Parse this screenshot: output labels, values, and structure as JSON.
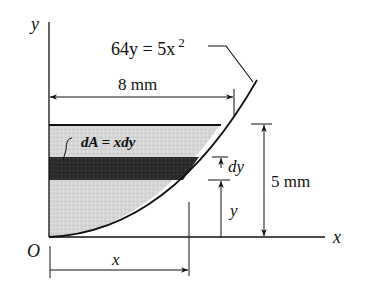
{
  "diagram": {
    "type": "area-element-diagram",
    "axes": {
      "y_label": "y",
      "x_label": "x",
      "origin_label": "O"
    },
    "curve": {
      "equation_lhs": "64y = 5x",
      "equation_exp": "2"
    },
    "dimensions": {
      "width_label": "8 mm",
      "height_label": "5 mm",
      "x_label": "x",
      "y_label": "y",
      "dy_label": "dy"
    },
    "element": {
      "label": "dA = xdy"
    },
    "colors": {
      "light_fill": "#d9d9d9",
      "dark_strip": "#2a2a2a",
      "line": "#111111"
    }
  }
}
